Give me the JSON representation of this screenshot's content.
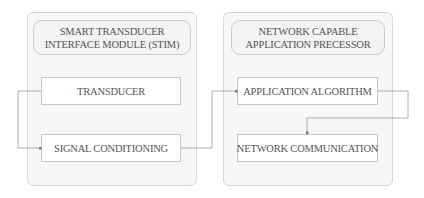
{
  "diagram": {
    "left_panel": {
      "title_lines": [
        "SMART TRANSDUCER",
        "INTERFACE MODULE (STIM)"
      ],
      "blocks": [
        "TRANSDUCER",
        "SIGNAL CONDITIONING"
      ]
    },
    "right_panel": {
      "title_lines": [
        "NETWORK CAPABLE",
        "APPLICATION PRECESSOR"
      ],
      "blocks": [
        "APPLICATION ALGORITHM",
        "NETWORK COMMUNICATION"
      ]
    },
    "connections": [
      {
        "from": "TRANSDUCER",
        "to": "SIGNAL CONDITIONING"
      },
      {
        "from": "SIGNAL CONDITIONING",
        "to": "APPLICATION ALGORITHM"
      },
      {
        "from": "APPLICATION ALGORITHM",
        "to": "NETWORK COMMUNICATION"
      }
    ],
    "colors": {
      "panel_fill": "#f7f7f7",
      "panel_border": "#d6d6d6",
      "block_border": "#c6c6c6",
      "wire": "#9a9a9a",
      "text": "#555555"
    }
  }
}
